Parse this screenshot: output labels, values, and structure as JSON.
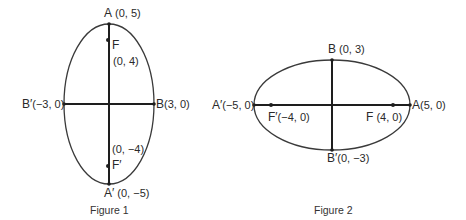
{
  "figure1": {
    "caption": "Figure 1",
    "ellipse": {
      "cx": 109,
      "cy": 104,
      "rx": 45,
      "ry": 80
    },
    "points": {
      "A": {
        "name": "A",
        "coords": "(0, 5)"
      },
      "F": {
        "name": "F",
        "coords": "(0, 4)"
      },
      "B": {
        "name": "B",
        "coords": "(3, 0)"
      },
      "B_prime": {
        "name": "B′",
        "coords": "(−3, 0)"
      },
      "F_prime": {
        "name": "F′",
        "coords": "(0, −4)"
      },
      "A_prime": {
        "name": "A′",
        "coords": "(0, −5)"
      }
    }
  },
  "figure2": {
    "caption": "Figure 2",
    "ellipse": {
      "cx": 332,
      "cy": 105,
      "rx": 78,
      "ry": 45
    },
    "points": {
      "B": {
        "name": "B",
        "coords": "(0, 3)"
      },
      "A": {
        "name": "A",
        "coords": "(5, 0)"
      },
      "A_prime": {
        "name": "A′",
        "coords": "(−5, 0)"
      },
      "F_prime": {
        "name": "F′",
        "coords": "(−4, 0)"
      },
      "F": {
        "name": "F",
        "coords": "(4, 0)"
      },
      "B_prime": {
        "name": "B′",
        "coords": "(0, −3)"
      }
    }
  },
  "colors": {
    "stroke": "#3a3a3a",
    "axis": "#1e1e1e",
    "text": "#2a2a2a"
  }
}
